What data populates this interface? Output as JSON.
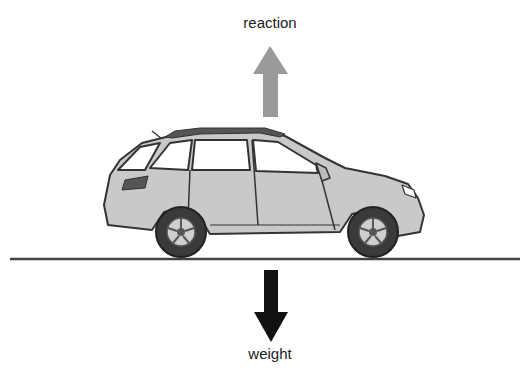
{
  "diagram": {
    "labels": {
      "top": "reaction",
      "bottom": "weight"
    },
    "arrows": [
      {
        "name": "reaction",
        "direction": "up",
        "color": "#9a9a9a"
      },
      {
        "name": "weight",
        "direction": "down",
        "color": "#111111"
      }
    ],
    "colors": {
      "car_body": "#c9c9c9",
      "outline": "#333333",
      "window": "#ffffff",
      "tire": "#3a3a3a",
      "ground": "#444444"
    }
  }
}
